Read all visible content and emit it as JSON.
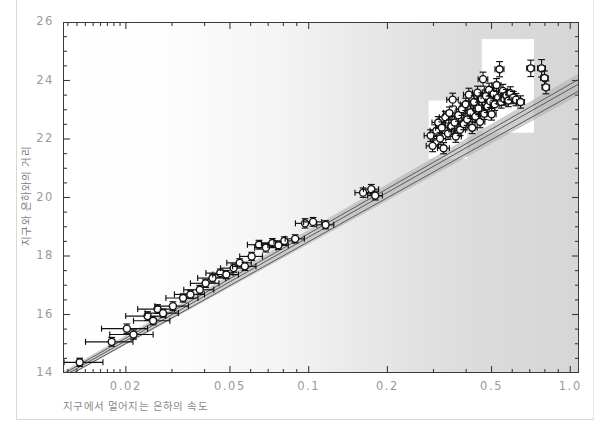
{
  "figure": {
    "background_color": "#ffffff",
    "plot_gradient_from": "#ffffff",
    "plot_gradient_to": "#d6d6d6",
    "frame_color": "#3a3a3a",
    "tick_label_color": "#9a9a9a",
    "axis_title_color": "#808080",
    "marker_edge_color": "#111111",
    "marker_fill_color": "#ffffff",
    "band_color": "#b4b4b4",
    "line_color": "#5a5a5a"
  },
  "chart_data": {
    "type": "scatter",
    "title": "",
    "xlabel": "지구에서 멀어지는 은하의 속도",
    "ylabel": "지구와 은하와의 거리",
    "xscale": "log",
    "yscale": "linear",
    "xlim": [
      0.0115,
      1.08
    ],
    "ylim": [
      14.0,
      26.0
    ],
    "grid": false,
    "legend": null,
    "xticks": [
      0.02,
      0.05,
      0.1,
      0.2,
      0.5,
      1.0
    ],
    "xticklabels": [
      "0.02",
      "0.05",
      "0.1",
      "0.2",
      "0.5",
      "1.0"
    ],
    "xminor_ticks": [
      0.012,
      0.013,
      0.014,
      0.015,
      0.016,
      0.017,
      0.018,
      0.019,
      0.03,
      0.04,
      0.06,
      0.07,
      0.08,
      0.09,
      0.3,
      0.4,
      0.6,
      0.7,
      0.8,
      0.9
    ],
    "yticks": [
      14,
      16,
      18,
      20,
      22,
      24,
      26
    ],
    "yticklabels": [
      "14",
      "16",
      "18",
      "20",
      "22",
      "24",
      "26"
    ],
    "yminor_ticks": [
      14.5,
      15,
      15.5,
      16.5,
      17,
      17.5,
      18.5,
      19,
      19.5,
      20.5,
      21,
      21.5,
      22.5,
      23,
      23.5,
      24.5,
      25,
      25.5
    ],
    "fit_lines": [
      {
        "name": "fit-upper",
        "x": [
          0.0115,
          1.08
        ],
        "y": [
          14.02,
          24.1
        ]
      },
      {
        "name": "fit-mid",
        "x": [
          0.0115,
          1.08
        ],
        "y": [
          13.94,
          23.94
        ]
      },
      {
        "name": "fit-lower",
        "x": [
          0.0115,
          1.08
        ],
        "y": [
          13.86,
          23.7
        ]
      }
    ],
    "confidence_band": {
      "name": "uncertainty-band",
      "x": [
        0.0115,
        1.08
      ],
      "y_upper": [
        14.1,
        24.3
      ],
      "y_lower": [
        13.84,
        23.55
      ]
    },
    "inset_boxes": [
      {
        "name": "inset-box-upper",
        "x0": 0.455,
        "x1": 0.72,
        "y0": 22.25,
        "y1": 25.45
      },
      {
        "name": "inset-box-lower",
        "x0": 0.285,
        "x1": 0.4,
        "y0": 21.35,
        "y1": 23.35
      }
    ],
    "points": [
      {
        "x": 0.0132,
        "y": 14.4,
        "xerr": 0.003,
        "yerr": 0.14
      },
      {
        "x": 0.0175,
        "y": 15.1,
        "xerr": 0.0036,
        "yerr": 0.15
      },
      {
        "x": 0.02,
        "y": 15.55,
        "xerr": 0.004,
        "yerr": 0.16
      },
      {
        "x": 0.0212,
        "y": 15.35,
        "xerr": 0.004,
        "yerr": 0.16
      },
      {
        "x": 0.024,
        "y": 15.98,
        "xerr": 0.0042,
        "yerr": 0.15
      },
      {
        "x": 0.0252,
        "y": 15.82,
        "xerr": 0.004,
        "yerr": 0.14
      },
      {
        "x": 0.0262,
        "y": 16.22,
        "xerr": 0.0042,
        "yerr": 0.15
      },
      {
        "x": 0.0275,
        "y": 16.08,
        "xerr": 0.004,
        "yerr": 0.14
      },
      {
        "x": 0.03,
        "y": 16.32,
        "xerr": 0.0044,
        "yerr": 0.15
      },
      {
        "x": 0.0328,
        "y": 16.6,
        "xerr": 0.0046,
        "yerr": 0.14
      },
      {
        "x": 0.035,
        "y": 16.72,
        "xerr": 0.0046,
        "yerr": 0.14
      },
      {
        "x": 0.038,
        "y": 16.88,
        "xerr": 0.005,
        "yerr": 0.15
      },
      {
        "x": 0.04,
        "y": 17.1,
        "xerr": 0.005,
        "yerr": 0.14
      },
      {
        "x": 0.0425,
        "y": 17.28,
        "xerr": 0.0052,
        "yerr": 0.14
      },
      {
        "x": 0.0455,
        "y": 17.45,
        "xerr": 0.0054,
        "yerr": 0.14
      },
      {
        "x": 0.048,
        "y": 17.4,
        "xerr": 0.0054,
        "yerr": 0.14
      },
      {
        "x": 0.0512,
        "y": 17.62,
        "xerr": 0.0056,
        "yerr": 0.14
      },
      {
        "x": 0.054,
        "y": 17.8,
        "xerr": 0.0058,
        "yerr": 0.14
      },
      {
        "x": 0.0565,
        "y": 17.68,
        "xerr": 0.0058,
        "yerr": 0.14
      },
      {
        "x": 0.06,
        "y": 18.02,
        "xerr": 0.006,
        "yerr": 0.14
      },
      {
        "x": 0.064,
        "y": 18.42,
        "xerr": 0.0062,
        "yerr": 0.15
      },
      {
        "x": 0.068,
        "y": 18.32,
        "xerr": 0.0064,
        "yerr": 0.15
      },
      {
        "x": 0.072,
        "y": 18.48,
        "xerr": 0.0066,
        "yerr": 0.15
      },
      {
        "x": 0.076,
        "y": 18.4,
        "xerr": 0.0068,
        "yerr": 0.14
      },
      {
        "x": 0.08,
        "y": 18.55,
        "xerr": 0.007,
        "yerr": 0.14
      },
      {
        "x": 0.088,
        "y": 18.62,
        "xerr": 0.0074,
        "yerr": 0.14
      },
      {
        "x": 0.096,
        "y": 19.15,
        "xerr": 0.0078,
        "yerr": 0.16
      },
      {
        "x": 0.103,
        "y": 19.2,
        "xerr": 0.0082,
        "yerr": 0.15
      },
      {
        "x": 0.115,
        "y": 19.1,
        "xerr": 0.0086,
        "yerr": 0.14
      },
      {
        "x": 0.16,
        "y": 20.2,
        "xerr": 0.011,
        "yerr": 0.16
      },
      {
        "x": 0.172,
        "y": 20.32,
        "xerr": 0.0115,
        "yerr": 0.16
      },
      {
        "x": 0.178,
        "y": 20.1,
        "xerr": 0.0115,
        "yerr": 0.15
      },
      {
        "x": 0.29,
        "y": 22.15,
        "xerr": 0.016,
        "yerr": 0.2
      },
      {
        "x": 0.295,
        "y": 21.8,
        "xerr": 0.016,
        "yerr": 0.2
      },
      {
        "x": 0.305,
        "y": 22.32,
        "xerr": 0.0165,
        "yerr": 0.2
      },
      {
        "x": 0.31,
        "y": 22.6,
        "xerr": 0.0165,
        "yerr": 0.2
      },
      {
        "x": 0.315,
        "y": 22.05,
        "xerr": 0.0165,
        "yerr": 0.2
      },
      {
        "x": 0.32,
        "y": 22.42,
        "xerr": 0.017,
        "yerr": 0.2
      },
      {
        "x": 0.325,
        "y": 21.72,
        "xerr": 0.017,
        "yerr": 0.19
      },
      {
        "x": 0.33,
        "y": 22.78,
        "xerr": 0.017,
        "yerr": 0.2
      },
      {
        "x": 0.338,
        "y": 22.22,
        "xerr": 0.0175,
        "yerr": 0.2
      },
      {
        "x": 0.342,
        "y": 22.92,
        "xerr": 0.0175,
        "yerr": 0.21
      },
      {
        "x": 0.348,
        "y": 22.48,
        "xerr": 0.0175,
        "yerr": 0.2
      },
      {
        "x": 0.352,
        "y": 23.38,
        "xerr": 0.0178,
        "yerr": 0.22
      },
      {
        "x": 0.358,
        "y": 22.6,
        "xerr": 0.0178,
        "yerr": 0.2
      },
      {
        "x": 0.362,
        "y": 22.12,
        "xerr": 0.0178,
        "yerr": 0.2
      },
      {
        "x": 0.37,
        "y": 22.85,
        "xerr": 0.018,
        "yerr": 0.21
      },
      {
        "x": 0.376,
        "y": 22.35,
        "xerr": 0.018,
        "yerr": 0.2
      },
      {
        "x": 0.382,
        "y": 23.05,
        "xerr": 0.0182,
        "yerr": 0.21
      },
      {
        "x": 0.388,
        "y": 22.55,
        "xerr": 0.0182,
        "yerr": 0.2
      },
      {
        "x": 0.395,
        "y": 23.22,
        "xerr": 0.0185,
        "yerr": 0.21
      },
      {
        "x": 0.4,
        "y": 22.7,
        "xerr": 0.0185,
        "yerr": 0.2
      },
      {
        "x": 0.406,
        "y": 23.55,
        "xerr": 0.0188,
        "yerr": 0.22
      },
      {
        "x": 0.412,
        "y": 22.95,
        "xerr": 0.0188,
        "yerr": 0.21
      },
      {
        "x": 0.418,
        "y": 22.42,
        "xerr": 0.0188,
        "yerr": 0.2
      },
      {
        "x": 0.425,
        "y": 23.3,
        "xerr": 0.019,
        "yerr": 0.21
      },
      {
        "x": 0.43,
        "y": 22.8,
        "xerr": 0.019,
        "yerr": 0.2
      },
      {
        "x": 0.438,
        "y": 23.62,
        "xerr": 0.0192,
        "yerr": 0.22
      },
      {
        "x": 0.442,
        "y": 23.08,
        "xerr": 0.0192,
        "yerr": 0.21
      },
      {
        "x": 0.448,
        "y": 22.62,
        "xerr": 0.0192,
        "yerr": 0.2
      },
      {
        "x": 0.455,
        "y": 23.4,
        "xerr": 0.0195,
        "yerr": 0.21
      },
      {
        "x": 0.46,
        "y": 24.08,
        "xerr": 0.0195,
        "yerr": 0.24
      },
      {
        "x": 0.465,
        "y": 22.9,
        "xerr": 0.0195,
        "yerr": 0.2
      },
      {
        "x": 0.472,
        "y": 23.5,
        "xerr": 0.0198,
        "yerr": 0.21
      },
      {
        "x": 0.478,
        "y": 23.15,
        "xerr": 0.0198,
        "yerr": 0.21
      },
      {
        "x": 0.485,
        "y": 23.72,
        "xerr": 0.02,
        "yerr": 0.22
      },
      {
        "x": 0.49,
        "y": 23.32,
        "xerr": 0.02,
        "yerr": 0.21
      },
      {
        "x": 0.496,
        "y": 22.88,
        "xerr": 0.02,
        "yerr": 0.2
      },
      {
        "x": 0.505,
        "y": 23.58,
        "xerr": 0.0205,
        "yerr": 0.22
      },
      {
        "x": 0.51,
        "y": 23.22,
        "xerr": 0.0205,
        "yerr": 0.21
      },
      {
        "x": 0.518,
        "y": 23.88,
        "xerr": 0.0208,
        "yerr": 0.22
      },
      {
        "x": 0.525,
        "y": 23.45,
        "xerr": 0.0208,
        "yerr": 0.21
      },
      {
        "x": 0.532,
        "y": 24.42,
        "xerr": 0.021,
        "yerr": 0.26
      },
      {
        "x": 0.54,
        "y": 23.3,
        "xerr": 0.021,
        "yerr": 0.21
      },
      {
        "x": 0.548,
        "y": 23.68,
        "xerr": 0.0212,
        "yerr": 0.22
      },
      {
        "x": 0.555,
        "y": 23.4,
        "xerr": 0.0212,
        "yerr": 0.21
      },
      {
        "x": 0.565,
        "y": 23.52,
        "xerr": 0.0215,
        "yerr": 0.21
      },
      {
        "x": 0.575,
        "y": 23.35,
        "xerr": 0.0215,
        "yerr": 0.21
      },
      {
        "x": 0.585,
        "y": 23.6,
        "xerr": 0.0218,
        "yerr": 0.22
      },
      {
        "x": 0.6,
        "y": 23.45,
        "xerr": 0.022,
        "yerr": 0.21
      },
      {
        "x": 0.615,
        "y": 23.38,
        "xerr": 0.0222,
        "yerr": 0.21
      },
      {
        "x": 0.64,
        "y": 23.3,
        "xerr": 0.0225,
        "yerr": 0.21
      },
      {
        "x": 0.7,
        "y": 24.45,
        "xerr": 0.024,
        "yerr": 0.28
      },
      {
        "x": 0.77,
        "y": 24.45,
        "xerr": 0.026,
        "yerr": 0.3
      },
      {
        "x": 0.79,
        "y": 24.12,
        "xerr": 0.026,
        "yerr": 0.24
      },
      {
        "x": 0.8,
        "y": 23.8,
        "xerr": 0.026,
        "yerr": 0.22
      }
    ]
  }
}
